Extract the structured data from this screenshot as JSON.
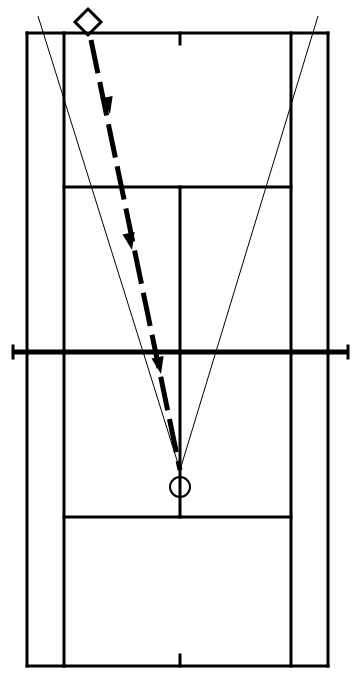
{
  "diagram": {
    "type": "tennis-court-play-diagram",
    "orientation": "portrait-overhead",
    "canvas": {
      "width": 358,
      "height": 681
    },
    "background_color": "#ffffff",
    "line_color": "#000000"
  },
  "court": {
    "doubles_sideline_left_x": 27,
    "doubles_sideline_right_x": 328,
    "singles_sideline_left_x": 64,
    "singles_sideline_right_x": 291,
    "baseline_top_y": 33,
    "baseline_bottom_y": 666,
    "service_line_top_y": 187,
    "service_line_bottom_y": 517,
    "net_y": 352,
    "center_service_line_x": 180,
    "center_mark_length": 11,
    "line_width": 3,
    "net_line_width": 5,
    "net_extent_left_x": 13,
    "net_extent_right_x": 348,
    "net_post_height": 12
  },
  "markers": [
    {
      "name": "player-diamond",
      "shape": "diamond",
      "fill": "none",
      "stroke": "#000000",
      "x": 88,
      "y": 22,
      "radius": 13,
      "role": "serving-player"
    },
    {
      "name": "player-circle",
      "shape": "circle",
      "fill": "none",
      "stroke": "#000000",
      "x": 180,
      "y": 487,
      "radius": 10,
      "role": "receiving-player"
    }
  ],
  "ball_path": {
    "name": "ball-trajectory",
    "style": "thick-dashed-arrow",
    "stroke": "#000000",
    "stroke_width": 5,
    "dash_pattern": "34 9",
    "start": {
      "x": 91,
      "y": 40
    },
    "end": {
      "x": 180,
      "y": 470
    },
    "arrowheads": [
      {
        "x": 110,
        "y": 114
      },
      {
        "x": 132,
        "y": 250
      },
      {
        "x": 161,
        "y": 374
      }
    ]
  },
  "coverage_lines": [
    {
      "name": "angle-line-left",
      "stroke": "#000000",
      "stroke_width": 1,
      "start": {
        "x": 38,
        "y": 16
      },
      "end": {
        "x": 180,
        "y": 470
      }
    },
    {
      "name": "angle-line-right",
      "stroke": "#000000",
      "stroke_width": 1,
      "start": {
        "x": 318,
        "y": 16
      },
      "end": {
        "x": 180,
        "y": 470
      }
    }
  ],
  "legend": {
    "diamond_meaning": "Player position (hitter)",
    "circle_meaning": "Player position (target)",
    "dashed_arrow_meaning": "Ball trajectory",
    "thin_lines_meaning": "Possible return angles"
  }
}
